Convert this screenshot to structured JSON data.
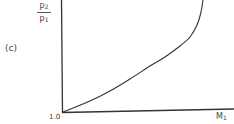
{
  "panel_label": "(c)",
  "chart_data": {
    "type": "line",
    "title": "",
    "panel": "(c)",
    "ylabel": "p2/p1",
    "ylabel_parts": {
      "numerator": "p",
      "numerator_sub": "2",
      "denominator": "p",
      "denominator_sub": "1"
    },
    "xlabel": "M1",
    "xlabel_parts": {
      "main": "M",
      "sub": "1"
    },
    "origin_label": "1.0",
    "grid": false,
    "legend": null,
    "series": [
      {
        "name": "p2/p1 vs M1",
        "description": "Monotonically increasing curve starting at origin (1.0), gently concave-up, rising steeply toward the top right",
        "points_px": [
          [
            63,
            112
          ],
          [
            90,
            101
          ],
          [
            110,
            91
          ],
          [
            130,
            79
          ],
          [
            150,
            66
          ],
          [
            165,
            57
          ],
          [
            180,
            46
          ],
          [
            190,
            37
          ],
          [
            197,
            25
          ],
          [
            201,
            12
          ],
          [
            203,
            0
          ]
        ]
      }
    ],
    "ticks": {
      "x": [],
      "y": []
    }
  },
  "ylabel": {
    "num": "p",
    "num_sub": "2",
    "den": "p",
    "den_sub": "1"
  },
  "xlabel": {
    "main": "M",
    "sub": "1"
  },
  "origin": "1.0"
}
